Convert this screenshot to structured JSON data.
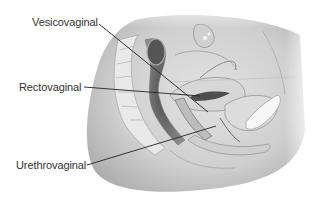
{
  "figure": {
    "style": "grayscale anatomical illustration",
    "labels": [
      {
        "id": "vesicovaginal",
        "text": "Vesicovaginal"
      },
      {
        "id": "rectovaginal",
        "text": "Rectovaginal"
      },
      {
        "id": "urethrovaginal",
        "text": "Urethrovaginal"
      }
    ]
  },
  "colors": {
    "background": "#ffffff",
    "label_text": "#333333",
    "leader_line": "#222222",
    "body_shade": "#c8c8c8",
    "body_light": "#e6e6e6",
    "organ_dark": "#6a6a6a"
  }
}
